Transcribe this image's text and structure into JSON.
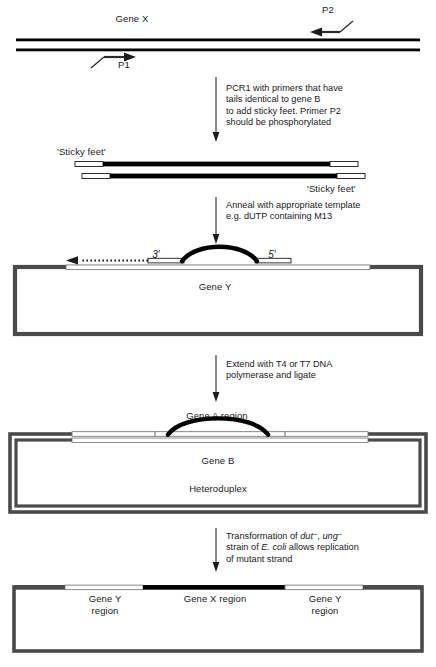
{
  "figure": {
    "colors": {
      "ink": "#111111",
      "strand_dark": "#000000",
      "strand_grey": "#4a4a4a",
      "strand_hollow_fill": "#ffffff",
      "box_outline": "#4a4a4a",
      "arrow": "#2b2b2b"
    }
  },
  "panel1": {
    "gene_label": "Gene X",
    "primer_forward": "P1",
    "primer_reverse": "P2"
  },
  "step1": {
    "lines": [
      "PCR1 with primers that have",
      "tails identical to gene B",
      "to add sticky feet. Primer P2",
      "should be phosphorylated"
    ]
  },
  "panel2": {
    "sticky_feet_top": "'Sticky feet'",
    "sticky_feet_bottom": "'Sticky feet'"
  },
  "step2": {
    "lines": [
      "Anneal with appropriate template",
      "e.g. dUTP containing M13"
    ]
  },
  "panel3": {
    "three_prime": "3′",
    "five_prime": "5′",
    "gene_label": "Gene Y"
  },
  "step3": {
    "lines": [
      "Extend with T4 or T7 DNA",
      "polymerase and ligate"
    ]
  },
  "panel4": {
    "gene_a_region": "Gene A region",
    "gene_b": "Gene B",
    "heteroduplex": "Heteroduplex"
  },
  "step4": {
    "line1_pre": "Transformation of ",
    "line1_gene1": "dut",
    "line1_sup1": "−",
    "line1_mid": ", ",
    "line1_gene2": "ung",
    "line1_sup2": "−",
    "line2_pre": "strain of ",
    "line2_species": "E. coli",
    "line2_post": " allows replication",
    "line3": "of mutant strand"
  },
  "panel5": {
    "left_region_line1": "Gene Y",
    "left_region_line2": "region",
    "centre_region": "Gene X region",
    "right_region_line1": "Gene Y",
    "right_region_line2": "region"
  }
}
